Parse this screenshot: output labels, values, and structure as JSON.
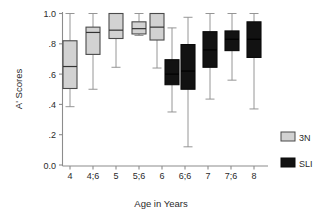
{
  "chart_data": {
    "type": "box",
    "title": "",
    "xlabel": "Age in Years",
    "ylabel": "A' Scores",
    "ylim": [
      0.0,
      1.0
    ],
    "ytick_labels": [
      "1.0",
      ".8",
      ".6",
      ".4",
      ".2",
      "0.0"
    ],
    "ytick_values": [
      1.0,
      0.8,
      0.6,
      0.4,
      0.2,
      0.0
    ],
    "categories": [
      "4",
      "4;6",
      "5",
      "5;6",
      "6",
      "6;6",
      "7",
      "7;6",
      "8"
    ],
    "grid": false,
    "legend_position": "right",
    "legend": [
      {
        "name": "3N",
        "color": "#d2d2d2"
      },
      {
        "name": "SLI",
        "color": "#121212"
      }
    ],
    "series": [
      {
        "name": "3N",
        "color": "#d2d2d2",
        "boxes": [
          {
            "category": "4",
            "min": 0.385,
            "q1": 0.505,
            "median": 0.65,
            "q3": 0.82,
            "max": 1.0
          },
          {
            "category": "4;6",
            "min": 0.5,
            "q1": 0.73,
            "median": 0.875,
            "q3": 0.91,
            "max": 1.0
          },
          {
            "category": "5",
            "min": 0.645,
            "q1": 0.835,
            "median": 0.89,
            "q3": 1.0,
            "max": 1.0
          },
          {
            "category": "5;6",
            "min": 0.855,
            "q1": 0.865,
            "median": 0.9,
            "q3": 0.945,
            "max": 1.0
          },
          {
            "category": "6",
            "min": 0.64,
            "q1": 0.825,
            "median": 0.91,
            "q3": 1.0,
            "max": 1.0
          }
        ]
      },
      {
        "name": "SLI",
        "color": "#121212",
        "boxes": [
          {
            "category": "6",
            "min": 0.35,
            "q1": 0.53,
            "median": 0.6,
            "q3": 0.695,
            "max": 0.905
          },
          {
            "category": "6;6",
            "min": 0.12,
            "q1": 0.5,
            "median": 0.62,
            "q3": 0.795,
            "max": 0.975
          },
          {
            "category": "7",
            "min": 0.435,
            "q1": 0.645,
            "median": 0.76,
            "q3": 0.88,
            "max": 1.0
          },
          {
            "category": "7;6",
            "min": 0.56,
            "q1": 0.755,
            "median": 0.83,
            "q3": 0.885,
            "max": 1.0
          },
          {
            "category": "8",
            "min": 0.37,
            "q1": 0.71,
            "median": 0.83,
            "q3": 0.945,
            "max": 1.0
          }
        ]
      }
    ]
  },
  "axes": {
    "y_title": "A' Scores",
    "x_title": "Age in Years",
    "y_labels": [
      "1.0",
      ".8",
      ".6",
      ".4",
      ".2",
      "0.0"
    ],
    "x_labels": [
      "4",
      "4;6",
      "5",
      "5;6",
      "6",
      "6;6",
      "7",
      "7;6",
      "8"
    ]
  },
  "legend": {
    "items": [
      {
        "label": "3N"
      },
      {
        "label": "SLI"
      }
    ]
  }
}
